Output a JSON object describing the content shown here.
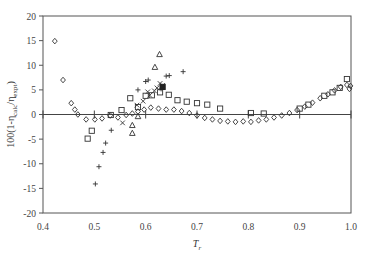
{
  "chart_data": {
    "type": "scatter",
    "title": "",
    "xlabel": "T_r",
    "ylabel": "100(1-η_calc/η_expt)",
    "xlim": [
      0.4,
      1.0
    ],
    "ylim": [
      -20,
      20
    ],
    "x_ticks": [
      "0.4",
      "0.5",
      "0.6",
      "0.7",
      "0.8",
      "0.9",
      "1.0"
    ],
    "y_ticks": [
      "20",
      "15",
      "10",
      "5",
      "0",
      "-5",
      "-10",
      "-15",
      "-20"
    ],
    "grid": false,
    "legend": "none",
    "zero_line": true,
    "series": [
      {
        "name": "diamond",
        "marker": "diamond",
        "points": [
          [
            0.423,
            14.9
          ],
          [
            0.439,
            7.0
          ],
          [
            0.455,
            2.3
          ],
          [
            0.462,
            1.0
          ],
          [
            0.468,
            0.0
          ],
          [
            0.484,
            -1.0
          ],
          [
            0.501,
            -1.0
          ],
          [
            0.515,
            -0.8
          ],
          [
            0.531,
            -0.2
          ],
          [
            0.546,
            -0.6
          ],
          [
            0.562,
            -0.1
          ],
          [
            0.574,
            0.2
          ],
          [
            0.585,
            0.6
          ],
          [
            0.597,
            1.0
          ],
          [
            0.61,
            1.4
          ],
          [
            0.625,
            1.2
          ],
          [
            0.64,
            1.0
          ],
          [
            0.655,
            1.0
          ],
          [
            0.67,
            0.7
          ],
          [
            0.685,
            0.3
          ],
          [
            0.7,
            -0.2
          ],
          [
            0.715,
            -0.7
          ],
          [
            0.73,
            -1.0
          ],
          [
            0.745,
            -1.3
          ],
          [
            0.76,
            -1.4
          ],
          [
            0.775,
            -1.5
          ],
          [
            0.79,
            -1.4
          ],
          [
            0.805,
            -1.5
          ],
          [
            0.82,
            -1.2
          ],
          [
            0.835,
            -1.0
          ],
          [
            0.85,
            -0.6
          ],
          [
            0.865,
            -0.2
          ],
          [
            0.88,
            0.3
          ],
          [
            0.895,
            0.9
          ],
          [
            0.91,
            1.6
          ],
          [
            0.925,
            2.4
          ],
          [
            0.94,
            3.3
          ],
          [
            0.955,
            4.1
          ],
          [
            0.968,
            4.9
          ],
          [
            0.98,
            5.6
          ],
          [
            0.992,
            6.0
          ],
          [
            0.997,
            5.2
          ],
          [
            0.999,
            5.8
          ]
        ]
      },
      {
        "name": "square",
        "marker": "square",
        "points": [
          [
            0.487,
            -4.9
          ],
          [
            0.495,
            -3.3
          ],
          [
            0.532,
            -0.1
          ],
          [
            0.553,
            0.9
          ],
          [
            0.57,
            3.3
          ],
          [
            0.585,
            1.5
          ],
          [
            0.6,
            3.8
          ],
          [
            0.612,
            3.9
          ],
          [
            0.628,
            4.5
          ],
          [
            0.645,
            4.0
          ],
          [
            0.662,
            2.9
          ],
          [
            0.68,
            2.6
          ],
          [
            0.7,
            2.3
          ],
          [
            0.72,
            2.0
          ],
          [
            0.745,
            1.2
          ],
          [
            0.805,
            0.3
          ],
          [
            0.83,
            0.2
          ],
          [
            0.9,
            1.2
          ],
          [
            0.917,
            2.0
          ],
          [
            0.948,
            3.8
          ],
          [
            0.964,
            4.5
          ],
          [
            0.978,
            5.4
          ],
          [
            0.992,
            7.2
          ]
        ]
      },
      {
        "name": "plus",
        "marker": "plus",
        "points": [
          [
            0.502,
            -14.1
          ],
          [
            0.509,
            -10.6
          ],
          [
            0.517,
            -7.7
          ],
          [
            0.522,
            -5.8
          ],
          [
            0.533,
            -3.2
          ],
          [
            0.585,
            5.0
          ],
          [
            0.6,
            6.7
          ],
          [
            0.605,
            7.0
          ],
          [
            0.63,
            5.2
          ],
          [
            0.64,
            7.8
          ],
          [
            0.646,
            7.9
          ],
          [
            0.673,
            8.7
          ]
        ]
      },
      {
        "name": "cross",
        "marker": "x",
        "points": [
          [
            0.555,
            -1.7
          ],
          [
            0.583,
            1.9
          ],
          [
            0.595,
            2.7
          ],
          [
            0.604,
            4.6
          ],
          [
            0.608,
            3.9
          ],
          [
            0.617,
            4.8
          ],
          [
            0.622,
            5.4
          ],
          [
            0.628,
            6.3
          ],
          [
            0.633,
            5.9
          ]
        ]
      },
      {
        "name": "triangle",
        "marker": "triangle",
        "points": [
          [
            0.574,
            -2.2
          ],
          [
            0.585,
            -0.4
          ],
          [
            0.618,
            9.6
          ],
          [
            0.627,
            12.2
          ],
          [
            0.574,
            -3.8
          ]
        ]
      },
      {
        "name": "filled-square",
        "marker": "filled-square",
        "points": [
          [
            0.633,
            5.6
          ]
        ]
      }
    ]
  }
}
